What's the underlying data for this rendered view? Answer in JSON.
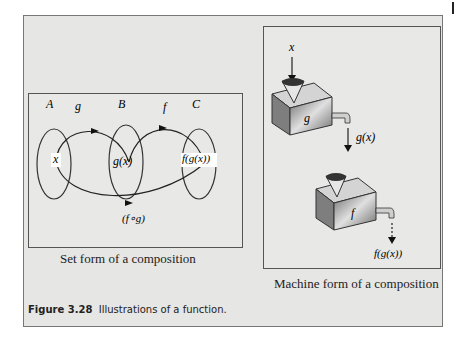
{
  "figure": {
    "label": "Figure 3.28",
    "caption": "Illustrations of a function."
  },
  "set_form": {
    "caption": "Set form of a composition",
    "sets": [
      "A",
      "B",
      "C"
    ],
    "maps": {
      "g": "g",
      "f": "f",
      "composite": "(f∘g)"
    },
    "elements": {
      "x": "x",
      "gx": "g(x)",
      "fgx": "f(g(x))"
    }
  },
  "machine_form": {
    "caption": "Machine form of a composition",
    "input": "x",
    "machine1": "g",
    "intermediate": "g(x)",
    "machine2": "f",
    "output": "f(g(x))"
  }
}
